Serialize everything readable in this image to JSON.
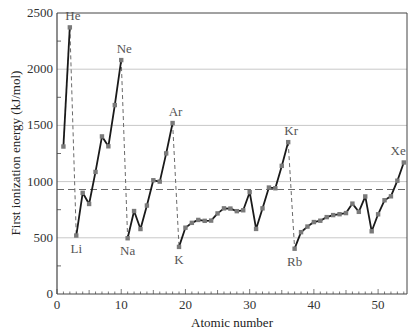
{
  "chart_data": {
    "type": "line",
    "title": "",
    "xlabel": "Atomic number",
    "ylabel": "First ionization energy (kJ/mol)",
    "xlim": [
      0,
      54.5
    ],
    "ylim": [
      0,
      2500
    ],
    "xticks": [
      0,
      10,
      20,
      30,
      40,
      50
    ],
    "yticks": [
      0,
      500,
      1000,
      1500,
      2000,
      2500
    ],
    "grid": {
      "y": true,
      "x": false
    },
    "reference_line": {
      "value": 930,
      "style": "dashed"
    },
    "x": [
      1,
      2,
      3,
      4,
      5,
      6,
      7,
      8,
      9,
      10,
      11,
      12,
      13,
      14,
      15,
      16,
      17,
      18,
      19,
      20,
      21,
      22,
      23,
      24,
      25,
      26,
      27,
      28,
      29,
      30,
      31,
      32,
      33,
      34,
      35,
      36,
      37,
      38,
      39,
      40,
      41,
      42,
      43,
      44,
      45,
      46,
      47,
      48,
      49,
      50,
      51,
      52,
      53,
      54
    ],
    "series": [
      {
        "name": "First ionization energy",
        "values": [
          1312,
          2372,
          520,
          900,
          801,
          1086,
          1402,
          1314,
          1681,
          2081,
          496,
          738,
          578,
          787,
          1012,
          1000,
          1251,
          1521,
          419,
          590,
          633,
          659,
          651,
          653,
          717,
          762,
          760,
          737,
          745,
          906,
          579,
          762,
          947,
          941,
          1140,
          1351,
          403,
          550,
          600,
          640,
          652,
          684,
          702,
          710,
          720,
          804,
          731,
          868,
          558,
          709,
          834,
          869,
          1008,
          1170
        ]
      }
    ],
    "period_breaks": [
      [
        2,
        3
      ],
      [
        10,
        11
      ],
      [
        18,
        19
      ],
      [
        36,
        37
      ]
    ],
    "annotations": [
      {
        "text": "He",
        "z": 2,
        "pos": "above"
      },
      {
        "text": "Ne",
        "z": 10,
        "pos": "above"
      },
      {
        "text": "Ar",
        "z": 18,
        "pos": "above"
      },
      {
        "text": "Kr",
        "z": 36,
        "pos": "above"
      },
      {
        "text": "Xe",
        "z": 54,
        "pos": "above-left"
      },
      {
        "text": "Li",
        "z": 3,
        "pos": "below"
      },
      {
        "text": "Na",
        "z": 11,
        "pos": "below"
      },
      {
        "text": "K",
        "z": 19,
        "pos": "below"
      },
      {
        "text": "Rb",
        "z": 37,
        "pos": "below"
      }
    ],
    "colors": {
      "line": "#1a1a1a",
      "marker": "#7a7a7a",
      "grid": "#c8c8c8",
      "dashed": "#6a6a6a",
      "axis": "#444444"
    }
  },
  "labels": {
    "xlabel": "Atomic number",
    "ylabel": "First ionization energy (kJ/mol)"
  }
}
